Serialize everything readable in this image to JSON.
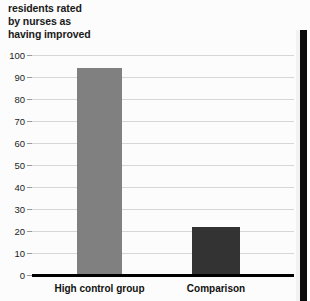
{
  "chart_data": {
    "type": "bar",
    "title": "residents rated by nurses as having improved",
    "title_lines": [
      "residents rated",
      "by nurses as",
      "having improved"
    ],
    "categories": [
      "High control group",
      "Comparison"
    ],
    "values": [
      94,
      22
    ],
    "series": [
      {
        "name": "percent of residents rated as improved",
        "values": [
          94,
          22
        ]
      }
    ],
    "xlabel": "",
    "ylabel": "",
    "ylim": [
      0,
      100
    ],
    "yticks": [
      0,
      10,
      20,
      30,
      40,
      50,
      60,
      70,
      80,
      90,
      100
    ],
    "ytick_labels": [
      "0",
      "10",
      "20",
      "30",
      "40",
      "50",
      "60",
      "70",
      "80",
      "90",
      "100"
    ],
    "grid": true,
    "legend": "none",
    "bar_colors": [
      "#808080",
      "#333333"
    ]
  },
  "colors": {
    "bar_high_control": "#808080",
    "bar_comparison": "#333333",
    "gridline": "#d6d6d6",
    "axis": "#000000",
    "text": "#111111",
    "background": "#fcfcfc",
    "page_edge": "#0a0a0a"
  }
}
